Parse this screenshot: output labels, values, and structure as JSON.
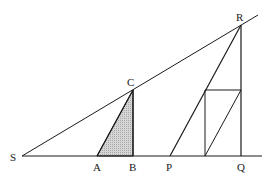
{
  "diagram": {
    "type": "geometry-similar-triangles",
    "points": {
      "S": {
        "label": "S",
        "x": 22,
        "y": 156
      },
      "A": {
        "label": "A",
        "x": 97,
        "y": 156
      },
      "B": {
        "label": "B",
        "x": 133,
        "y": 156
      },
      "C": {
        "label": "C",
        "x": 133,
        "y": 90
      },
      "P": {
        "label": "P",
        "x": 170,
        "y": 156
      },
      "Q": {
        "label": "Q",
        "x": 241,
        "y": 156
      },
      "R": {
        "label": "R",
        "x": 241,
        "y": 25
      }
    },
    "labels": {
      "S": "S",
      "A": "A",
      "B": "B",
      "C": "C",
      "P": "P",
      "Q": "Q",
      "R": "R"
    },
    "shaded_triangle": "ABC",
    "shade_color": "#c8c8c8",
    "line_color": "#1a1a1a",
    "segments": [
      "S-Q baseline (extended)",
      "S-R line (extended past R)",
      "A-C",
      "B-C",
      "P-R",
      "Q-R",
      "rectangle inside triangle PQR",
      "diagonal of rectangle"
    ]
  }
}
